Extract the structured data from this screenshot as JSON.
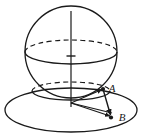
{
  "figure": {
    "type": "3d-geometry-diagram",
    "background_color": "#ffffff",
    "stroke_color": "#1a1a1a",
    "labels": [
      {
        "id": "A",
        "text": "A",
        "x": 112,
        "y": 92
      },
      {
        "id": "B",
        "text": "B",
        "x": 122,
        "y": 121
      }
    ],
    "sphere": {
      "center_x": 71,
      "center_y": 52,
      "radius_x": 46,
      "radius_y": 46,
      "equator_ry": 12,
      "equator_cy": 52
    },
    "axis": {
      "top_y": 12,
      "bottom_y": 108,
      "x": 71,
      "tick_y": 56,
      "tick_half_width": 4
    },
    "plane": {
      "center_x": 71,
      "center_y": 110,
      "radius_x": 66,
      "radius_y": 22
    },
    "section_circle": {
      "center_x": 71,
      "center_y": 96,
      "radius_x": 39,
      "radius_y": 9
    },
    "points": {
      "origin": {
        "x": 71,
        "y": 103
      },
      "A": {
        "x": 103,
        "y": 89
      },
      "B": {
        "x": 111,
        "y": 117
      }
    }
  }
}
